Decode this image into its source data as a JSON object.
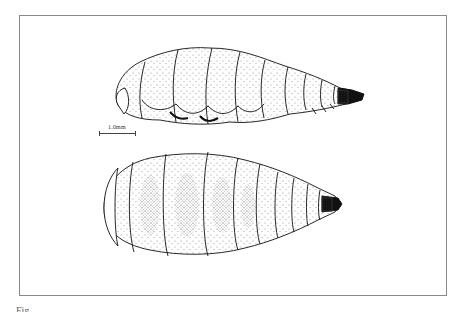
{
  "figure": {
    "type": "scientific-illustration",
    "views": [
      {
        "name": "lateral-view",
        "position": "top"
      },
      {
        "name": "dorsal-view",
        "position": "bottom"
      }
    ],
    "scale_bar": {
      "label": "1.0mm"
    },
    "caption_partial": "Fig. ...",
    "colors": {
      "ink": "#111111",
      "frame": "#8a8a8a",
      "background": "#ffffff"
    }
  }
}
